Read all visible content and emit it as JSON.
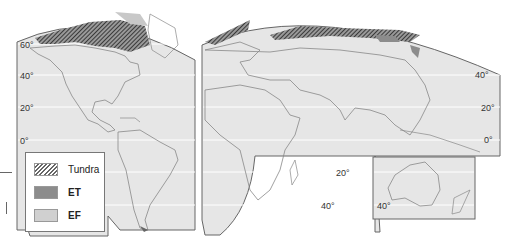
{
  "map": {
    "title": "",
    "type": "World map – polar climates (tundra ET / ice cap EF)",
    "panels": [
      "Americas",
      "Eurasia-Africa",
      "Australia-NZ inset"
    ],
    "latitude_labels_americas": [
      "60°",
      "40°",
      "20°",
      "0°"
    ],
    "latitude_labels_eurasia": [
      "40°",
      "20°",
      "0°"
    ],
    "latitude_labels_africa": [
      "20°",
      "40°"
    ],
    "latitude_labels_australia": [
      "40°"
    ]
  },
  "legend": {
    "items": [
      {
        "label": "Tundra",
        "pattern": "hatched"
      },
      {
        "label": "ET",
        "color": "#8c8c8c"
      },
      {
        "label": "EF",
        "color": "#d0d0d0"
      }
    ]
  },
  "colors": {
    "land_background": "#e6e6e6",
    "border": "#666666",
    "tundra_hatch": "#444444"
  }
}
